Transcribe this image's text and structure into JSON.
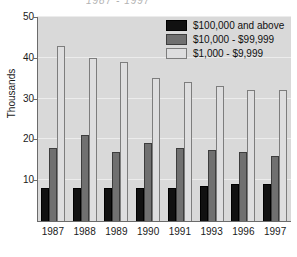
{
  "chart_data": {
    "type": "bar",
    "title": "",
    "xlabel": "",
    "ylabel": "Thousands",
    "ylim": [
      0,
      50
    ],
    "yticks": [
      10,
      20,
      30,
      40,
      50
    ],
    "grid": true,
    "legend_position": "top-right",
    "categories": [
      "1987",
      "1988",
      "1989",
      "1990",
      "1991",
      "1993",
      "1996",
      "1997"
    ],
    "series": [
      {
        "name": "$100,000 and above",
        "color": "#111111",
        "values": [
          8.0,
          8.0,
          8.0,
          8.0,
          8.0,
          8.7,
          9.0,
          9.0
        ]
      },
      {
        "name": "$10,000 - $99,999",
        "color": "#707070",
        "values": [
          18.0,
          21.0,
          17.0,
          19.0,
          18.0,
          17.3,
          17.0,
          16.0
        ]
      },
      {
        "name": "$1,000 - $9,999",
        "color": "#dededf",
        "values": [
          43.0,
          40.0,
          39.0,
          35.0,
          34.0,
          33.0,
          32.0,
          32.0
        ]
      }
    ]
  },
  "figure": {
    "title_remnant": "1987 - 1997",
    "plot_background": "#d9d9d9",
    "page_background": "#ffffff",
    "axis_color": "#6b6b6b",
    "grid_color": "#ececec"
  }
}
